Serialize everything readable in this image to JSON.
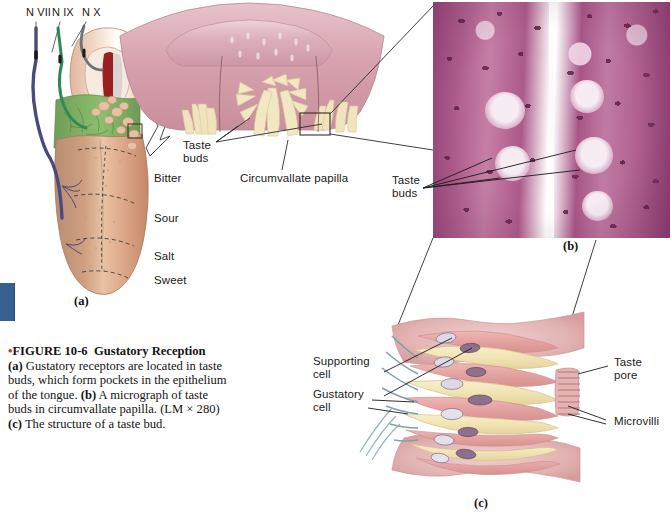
{
  "figure": {
    "number": "FIGURE 10-6",
    "title": "Gustatory Reception",
    "bullet": "•",
    "caption_a_tag": "(a)",
    "caption_a_text": " Gustatory receptors are located in taste buds, which form pockets in the epithelium of the tongue. ",
    "caption_b_tag": "(b)",
    "caption_b_text": " A micrograph of taste buds in circumvallate papilla. (LM × 280) ",
    "caption_c_tag": "(c)",
    "caption_c_text": " The structure of a taste bud."
  },
  "panels": {
    "a": {
      "letter": "(a)",
      "name": "tongue-with-cranial-nerves"
    },
    "b": {
      "letter": "(b)",
      "name": "taste-bud-micrograph"
    },
    "c": {
      "letter": "(c)",
      "name": "taste-bud-structure-diagram"
    }
  },
  "nerves": [
    {
      "label": "N VII",
      "color": "#4a4a7f"
    },
    {
      "label": "N IX",
      "color": "#2e8b57"
    },
    {
      "label": "N X",
      "color": "#6f7276"
    }
  ],
  "taste_regions": [
    {
      "label": "Bitter"
    },
    {
      "label": "Sour"
    },
    {
      "label": "Salt"
    },
    {
      "label": "Sweet"
    }
  ],
  "papilla_panel": {
    "taste_buds_label": "Taste\nbuds",
    "papilla_label": "Circumvallate papilla"
  },
  "micrograph_panel": {
    "taste_buds_label": "Taste\nbuds",
    "magnification": "LM × 280"
  },
  "taste_bud_panel": {
    "supporting_cell_label": "Supporting\ncell",
    "gustatory_cell_label": "Gustatory\ncell",
    "taste_pore_label": "Taste\npore",
    "microvilli_label": "Microvilli"
  },
  "colors": {
    "accent_bullet": "#c0392b",
    "edge_tab": "#36618e",
    "tongue_flesh": "#d9a183",
    "tongue_root_green": "#7cab63",
    "papilla_pink": "#dba9b4",
    "taste_bud_cream": "#f2e6bd",
    "micrograph_purple": "#a8538a",
    "leader_line": "#2b2b2b"
  }
}
